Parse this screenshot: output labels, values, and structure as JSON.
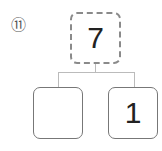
{
  "problem": {
    "number_label": "⑪",
    "whole": "7",
    "parts": [
      "",
      "1"
    ]
  }
}
